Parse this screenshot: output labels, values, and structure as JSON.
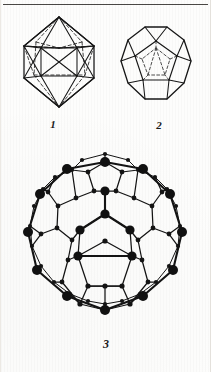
{
  "page": {
    "kind": "figure-plate",
    "background_color": "#fdfdfc",
    "ink_color": "#171717",
    "rule_color": "#4a4845",
    "has_top_rule": true
  },
  "captions": {
    "figure1": "1",
    "figure2": "2",
    "figure3": "3"
  },
  "figures": [
    {
      "number": "1",
      "name": "icosahedron",
      "style": "wireframe-with-hidden-dashed-edges",
      "vertices": 12,
      "edges": 30,
      "faces": 20,
      "bbox": {
        "x": 18,
        "y": 12,
        "w": 80,
        "h": 100
      }
    },
    {
      "number": "2",
      "name": "dodecahedron",
      "style": "wireframe-face-on-with-hidden-dashed-edges",
      "vertices": 20,
      "edges": 30,
      "faces": 12,
      "bbox": {
        "x": 117,
        "y": 24,
        "w": 76,
        "h": 86
      }
    },
    {
      "number": "3",
      "name": "truncated-icosahedron-fullerene",
      "style": "ball-and-stick-with-near-and-far-vertices",
      "vertices": 60,
      "edges": 90,
      "faces": 32,
      "pentagons": 12,
      "hexagons": 20,
      "bbox": {
        "x": 9,
        "y": 144,
        "w": 190,
        "h": 190
      }
    }
  ]
}
